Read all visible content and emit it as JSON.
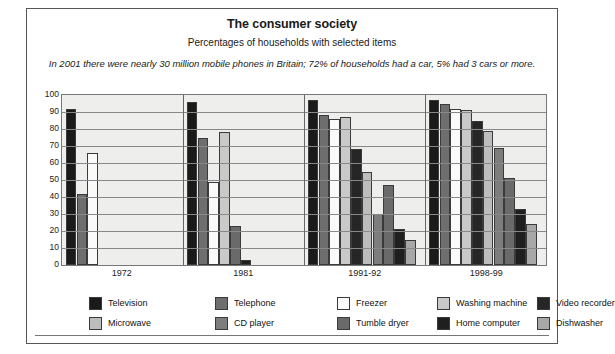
{
  "header": {
    "title": "The consumer society",
    "subtitle": "Percentages of households with selected items",
    "standfirst": "In 2001 there were nearly 30 million mobile phones in Britain; 72% of households had a car, 5% had 3 cars or more."
  },
  "colors": {
    "television": "#1a1a1a",
    "telephone": "#6e6e6e",
    "freezer": "#fafafa",
    "washing_machine": "#c9c9c9",
    "video_recorder": "#262626",
    "microwave": "#bdbdbd",
    "cd_player": "#7d7d7d",
    "tumble_dryer": "#6a6a6a",
    "home_computer": "#1f1f1f",
    "dishwasher": "#a8a8a8",
    "plot_background": "#eeeeec",
    "gridline": "#888888",
    "axis": "#777777",
    "border": "#555555"
  },
  "legend": {
    "items": [
      {
        "label": "Television",
        "key": "television"
      },
      {
        "label": "Telephone",
        "key": "telephone"
      },
      {
        "label": "Freezer",
        "key": "freezer"
      },
      {
        "label": "Washing machine",
        "key": "washing_machine"
      },
      {
        "label": "Video recorder",
        "key": "video_recorder"
      },
      {
        "label": "Microwave",
        "key": "microwave"
      },
      {
        "label": "CD player",
        "key": "cd_player"
      },
      {
        "label": "Tumble dryer",
        "key": "tumble_dryer"
      },
      {
        "label": "Home computer",
        "key": "home_computer"
      },
      {
        "label": "Dishwasher",
        "key": "dishwasher"
      }
    ]
  },
  "chart_data": {
    "type": "bar",
    "title": "The consumer society",
    "subtitle": "Percentages of households with selected items",
    "xlabel": "",
    "ylabel": "",
    "ylim": [
      0,
      100
    ],
    "yticks": [
      0,
      10,
      20,
      30,
      40,
      50,
      60,
      70,
      80,
      90,
      100
    ],
    "grid": true,
    "legend_position": "bottom",
    "categories": [
      "1972",
      "1981",
      "1991-92",
      "1998-99"
    ],
    "series": [
      {
        "name": "Television",
        "key": "television",
        "values": [
          92,
          96,
          97,
          97
        ]
      },
      {
        "name": "Telephone",
        "key": "telephone",
        "values": [
          42,
          75,
          88,
          95
        ]
      },
      {
        "name": "Freezer",
        "key": "freezer",
        "values": [
          66,
          49,
          86,
          92
        ]
      },
      {
        "name": "Washing machine",
        "key": "washing_machine",
        "values": [
          null,
          78,
          87,
          91
        ]
      },
      {
        "name": "Video recorder",
        "key": "video_recorder",
        "values": [
          null,
          null,
          68,
          85
        ]
      },
      {
        "name": "Microwave",
        "key": "microwave",
        "values": [
          null,
          null,
          55,
          79
        ]
      },
      {
        "name": "CD player",
        "key": "cd_player",
        "values": [
          null,
          null,
          30,
          69
        ]
      },
      {
        "name": "Tumble dryer",
        "key": "tumble_dryer",
        "values": [
          null,
          23,
          47,
          51
        ]
      },
      {
        "name": "Home computer",
        "key": "home_computer",
        "values": [
          null,
          3,
          21,
          33
        ]
      },
      {
        "name": "Dishwasher",
        "key": "dishwasher",
        "values": [
          null,
          null,
          15,
          24
        ]
      }
    ]
  }
}
